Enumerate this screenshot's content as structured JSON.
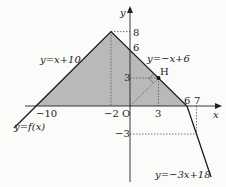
{
  "figure": {
    "axis_x_label": "x",
    "axis_y_label": "y",
    "origin_label": "O",
    "point_H_label": "H",
    "curve_label": "y=f(x)",
    "line_labels": {
      "left": "y=x+10",
      "middle": "y=−x+6",
      "right": "y=−3x+18"
    },
    "x_ticks": [
      "−10",
      "−2",
      "3",
      "6",
      "7"
    ],
    "y_ticks": [
      "8",
      "6",
      "3",
      "−3"
    ],
    "colors": {
      "shade": "#b9b9b9",
      "line": "#1a1a1a",
      "dotted": "#444444"
    },
    "vertices": [
      {
        "x": -10,
        "y": 0
      },
      {
        "x": -2,
        "y": 8
      },
      {
        "x": 6,
        "y": 0
      },
      {
        "x": 7,
        "y": -3
      }
    ],
    "H": {
      "x": 3,
      "y": 3
    }
  }
}
